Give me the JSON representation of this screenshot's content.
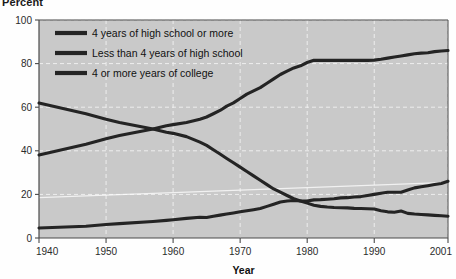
{
  "figure": {
    "y_axis_title": "Percent",
    "x_axis_title": "Year",
    "plot_bg": "#c9c9c9",
    "line_color": "#242424",
    "grid_color": "#f2f2f2",
    "axis_color": "#4a4a4a",
    "page_bg": "#fefefe"
  },
  "legend": {
    "position": "top-left-inside",
    "entries": [
      {
        "label": "4 years of high school or more",
        "color": "#242424"
      },
      {
        "label": "Less than 4 years of high school",
        "color": "#242424"
      },
      {
        "label": "4 or more years of college",
        "color": "#242424"
      }
    ]
  },
  "chart_data": {
    "type": "line",
    "title": "",
    "subtitle": "",
    "xlabel": "Year",
    "ylabel": "Percent",
    "xlim": [
      1940,
      2001
    ],
    "ylim": [
      0,
      100
    ],
    "yticks": [
      0,
      20,
      40,
      60,
      80,
      100
    ],
    "xticks": [
      1940,
      1950,
      1960,
      1970,
      1980,
      1990,
      2001
    ],
    "xtick_labels": [
      "1940",
      "1950",
      "1960",
      "1970",
      "1980",
      "1990",
      "2001"
    ],
    "ytick_labels": [
      "0",
      "20",
      "40",
      "60",
      "80",
      "100"
    ],
    "grid": "dashed-white-horizontal-and-vertical",
    "legend_position": "upper left (inside plot)",
    "annotations": [],
    "series": [
      {
        "name": "4 years of high school or more",
        "color": "#242424",
        "x": [
          1940,
          1947,
          1950,
          1952,
          1957,
          1959,
          1960,
          1962,
          1964,
          1965,
          1966,
          1967,
          1968,
          1969,
          1970,
          1971,
          1972,
          1973,
          1974,
          1975,
          1976,
          1977,
          1978,
          1979,
          1980,
          1981,
          1982,
          1983,
          1984,
          1985,
          1986,
          1987,
          1988,
          1989,
          1990,
          1991,
          1992,
          1993,
          1994,
          1995,
          1996,
          1997,
          1998,
          1999,
          2000,
          2001
        ],
        "y": [
          38.1,
          43.0,
          45.5,
          47.0,
          50.0,
          51.5,
          52.0,
          53.0,
          54.5,
          55.5,
          57.0,
          58.5,
          60.5,
          62.0,
          64.0,
          66.0,
          67.5,
          69.0,
          71.0,
          73.0,
          75.0,
          76.5,
          78.0,
          79.0,
          80.5,
          81.5,
          81.5,
          81.5,
          81.5,
          81.5,
          81.5,
          81.5,
          81.5,
          81.5,
          81.6,
          82.0,
          82.5,
          83.0,
          83.5,
          84.0,
          84.5,
          84.8,
          85.0,
          85.5,
          85.8,
          86.0
        ]
      },
      {
        "name": "Less than 4 years of high school",
        "color": "#242424",
        "x": [
          1940,
          1947,
          1950,
          1952,
          1957,
          1959,
          1960,
          1962,
          1964,
          1965,
          1966,
          1967,
          1968,
          1969,
          1970,
          1971,
          1972,
          1973,
          1974,
          1975,
          1976,
          1977,
          1978,
          1979,
          1980,
          1981,
          1982,
          1983,
          1984,
          1985,
          1986,
          1987,
          1988,
          1989,
          1990,
          1991,
          1992,
          1993,
          1994,
          1995,
          1996,
          1997,
          1998,
          1999,
          2000,
          2001
        ],
        "y": [
          61.9,
          57.0,
          54.5,
          53.0,
          50.0,
          48.5,
          48.0,
          46.5,
          44.0,
          42.5,
          40.5,
          38.5,
          36.5,
          34.5,
          32.5,
          30.5,
          28.5,
          26.5,
          24.5,
          22.5,
          21.0,
          19.5,
          18.0,
          17.0,
          16.0,
          15.0,
          14.5,
          14.2,
          14.0,
          13.9,
          13.8,
          13.6,
          13.5,
          13.4,
          13.3,
          12.5,
          12.0,
          11.8,
          12.4,
          11.3,
          11.0,
          10.8,
          10.6,
          10.4,
          10.2,
          10.0
        ]
      },
      {
        "name": "4 or more years of college",
        "color": "#242424",
        "x": [
          1940,
          1947,
          1950,
          1952,
          1957,
          1959,
          1960,
          1962,
          1964,
          1965,
          1966,
          1967,
          1968,
          1969,
          1970,
          1971,
          1972,
          1973,
          1974,
          1975,
          1976,
          1977,
          1978,
          1979,
          1980,
          1981,
          1982,
          1983,
          1984,
          1985,
          1986,
          1987,
          1988,
          1989,
          1990,
          1991,
          1992,
          1993,
          1994,
          1995,
          1996,
          1997,
          1998,
          1999,
          2000,
          2001
        ],
        "y": [
          4.6,
          5.4,
          6.2,
          6.6,
          7.6,
          8.1,
          8.4,
          9.0,
          9.5,
          9.4,
          10.0,
          10.5,
          11.0,
          11.5,
          12.0,
          12.5,
          13.0,
          13.5,
          14.5,
          15.5,
          16.5,
          17.0,
          17.2,
          17.0,
          17.0,
          17.5,
          17.6,
          17.8,
          18.0,
          18.4,
          18.5,
          18.8,
          19.0,
          19.5,
          20.0,
          20.5,
          21.0,
          21.0,
          21.0,
          22.0,
          23.0,
          23.5,
          24.0,
          24.5,
          25.0,
          26.0
        ]
      }
    ]
  }
}
